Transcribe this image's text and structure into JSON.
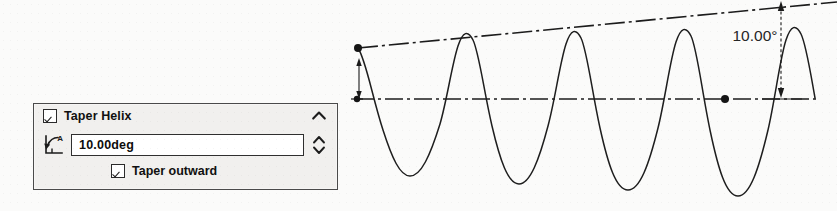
{
  "panel": {
    "title": "Taper Helix",
    "title_checkbox_checked": true,
    "collapse_icon": "chevron-up-icon",
    "angle_icon": "taper-angle-icon",
    "angle_value": "10.00deg",
    "angle_placeholder": "10.00deg",
    "spinner_icon": "spinner-up-down-icon",
    "outward_label": "Taper outward",
    "outward_checked": true,
    "colors": {
      "panel_bg": "#f1f0ee",
      "panel_border": "#4a4a4a",
      "field_bg": "#ffffff",
      "text": "#101010"
    }
  },
  "drawing": {
    "dimension_label": "10.00°",
    "line_color": "#1b1b1b",
    "background": "#fbfbfa",
    "helix": {
      "peaks_x": [
        443,
        530,
        618,
        705
      ],
      "origin_point": [
        358,
        48
      ],
      "axis_y": 99
    }
  }
}
